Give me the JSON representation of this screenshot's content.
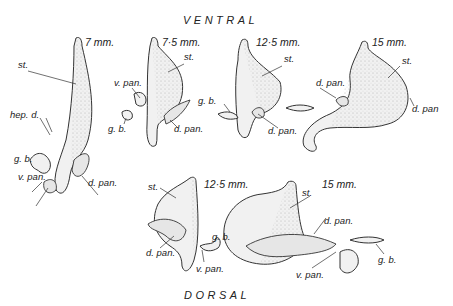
{
  "headings": {
    "top": "VENTRAL",
    "bottom": "DORSAL"
  },
  "figures": [
    {
      "id": "ventral-7mm",
      "stage": "7 mm.",
      "labels": [
        "st.",
        "hep. d.",
        "g. b.",
        "v. pan.",
        "d. pan."
      ]
    },
    {
      "id": "ventral-7-5mm",
      "stage": "7·5 mm.",
      "labels": [
        "st.",
        "v. pan.",
        "g. b.",
        "d. pan."
      ]
    },
    {
      "id": "ventral-12-5mm",
      "stage": "12·5 mm.",
      "labels": [
        "st.",
        "g. b.",
        "d. pan."
      ]
    },
    {
      "id": "ventral-15mm",
      "stage": "15 mm.",
      "labels": [
        "st.",
        "d. pan.",
        "d. pan"
      ]
    },
    {
      "id": "dorsal-12-5mm",
      "stage": "12·5 mm.",
      "labels": [
        "st.",
        "d. pan.",
        "g. b.",
        "v. pan."
      ]
    },
    {
      "id": "dorsal-15mm",
      "stage": "15 mm.",
      "labels": [
        "st.",
        "d. pan.",
        "g. b.",
        "v. pan."
      ]
    }
  ],
  "legend": {
    "st.": "stomach",
    "d. pan.": "dorsal pancreas",
    "v. pan.": "ventral pancreas",
    "g. b.": "gall bladder",
    "hep. d.": "hepatic duct"
  }
}
